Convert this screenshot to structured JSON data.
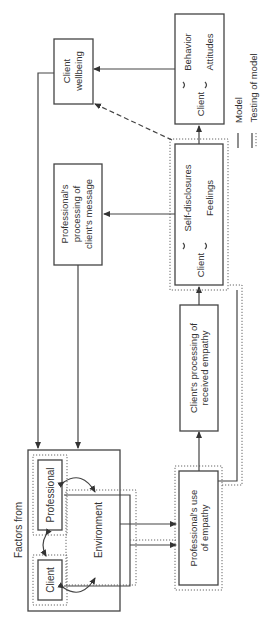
{
  "diagram": {
    "factors_group": {
      "title": "Factors from",
      "professional": "Professional",
      "client": "Client",
      "environment": "Environment"
    },
    "professional_use": {
      "line1": "Professional's use",
      "line2": "of empathy"
    },
    "client_processing": {
      "line1": "Client's processing of",
      "line2": "received empathy"
    },
    "client_disclosure": {
      "subject": "Client",
      "item1": "Self-disclosures",
      "item2": "Feelings"
    },
    "client_outcomes": {
      "subject": "Client",
      "item1": "Behavior",
      "item2": "Attitudes"
    },
    "professional_processing": {
      "line1": "Professional's",
      "line2": "processing of",
      "line3": "client's message"
    },
    "client_wellbeing": {
      "line1": "Client",
      "line2": "wellbeing"
    },
    "legend": {
      "model": "Model",
      "testing": "Testing of model"
    }
  }
}
